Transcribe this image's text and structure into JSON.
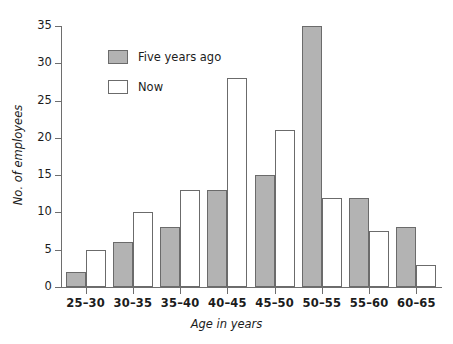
{
  "chart_data": {
    "type": "bar",
    "title": "",
    "xlabel": "Age in years",
    "ylabel": "No. of employees",
    "categories": [
      "25–30",
      "30–35",
      "35–40",
      "40–45",
      "45–50",
      "50–55",
      "55–60",
      "60–65"
    ],
    "series": [
      {
        "name": "Five years ago",
        "color": "#b3b3b3",
        "values": [
          2,
          6,
          8,
          13,
          15,
          35,
          12,
          8
        ]
      },
      {
        "name": "Now",
        "color": "#ffffff",
        "values": [
          5,
          10,
          13,
          28,
          21,
          12,
          7.5,
          3
        ]
      }
    ],
    "ylim": [
      0,
      35
    ],
    "yticks": [
      0,
      5,
      10,
      15,
      20,
      25,
      30,
      35
    ],
    "ytick_labels": [
      "0",
      "5",
      "10",
      "15",
      "20",
      "25",
      "30",
      "35"
    ],
    "grid": false,
    "legend_position": "upper-left-inside"
  }
}
